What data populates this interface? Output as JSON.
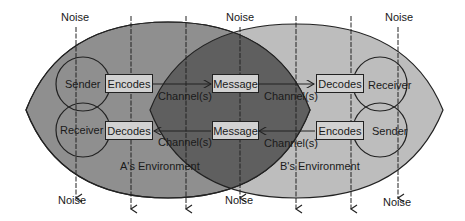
{
  "diagram": {
    "type": "transactional communication model",
    "colors": {
      "a_environment": "#8f8f8f",
      "b_environment": "#bdbdbd",
      "overlap": "#5f5f5f",
      "box_fill": "#d2d2d2",
      "stroke": "#222222"
    },
    "noise_labels": {
      "top_left": "Noise",
      "top_center": "Noise",
      "top_right": "Noise",
      "bottom_left": "Noise",
      "bottom_center": "Noise",
      "bottom_right": "Noise"
    },
    "a_side": {
      "environment": "A's Environment",
      "top_role": "Sender",
      "bottom_role": "Receiver",
      "top_box": "Encodes",
      "bottom_box": "Decodes"
    },
    "b_side": {
      "environment": "B's Environment",
      "top_role": "Receiver",
      "bottom_role": "Sender",
      "top_box": "Decodes",
      "bottom_box": "Encodes"
    },
    "center": {
      "top_box": "Message",
      "bottom_box": "Message"
    },
    "channels": {
      "top_left": "Channel(s)",
      "top_right": "Channel(s)",
      "bottom_left": "Channel(s)",
      "bottom_right": "Channel(s)"
    }
  }
}
